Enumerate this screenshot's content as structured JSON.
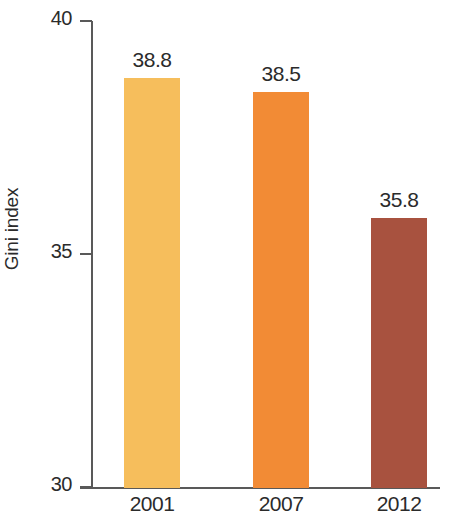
{
  "chart_data": {
    "type": "bar",
    "title": "",
    "xlabel": "",
    "ylabel": "Gini index",
    "categories": [
      "2001",
      "2007",
      "2012"
    ],
    "values": [
      38.8,
      38.5,
      35.8
    ],
    "value_labels": [
      "38.8",
      "38.5",
      "35.8"
    ],
    "ylim": [
      30,
      40
    ],
    "yticks": [
      30,
      35,
      40
    ],
    "ytick_labels": [
      "30",
      "35",
      "40"
    ],
    "grid": false,
    "legend": false,
    "bar_colors": [
      "#F6BE5C",
      "#F28B35",
      "#A8523F"
    ],
    "axis_color": "#595959",
    "text_color": "#2b2b2b",
    "series": [
      {
        "name": "Gini index",
        "values": [
          38.8,
          38.5,
          35.8
        ]
      }
    ]
  }
}
